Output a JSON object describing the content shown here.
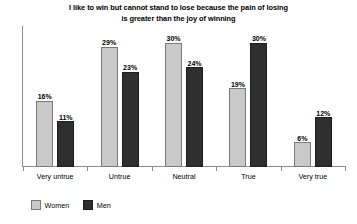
{
  "chart_data": {
    "type": "bar",
    "title": "I like to win but cannot stand to lose because the pain of losing is greater than the joy of winning",
    "title_lines": [
      "I like to win but cannot stand to lose because the pain of losing",
      "is greater than the joy of winning"
    ],
    "xlabel": "",
    "ylabel": "",
    "ylim": [
      0,
      34
    ],
    "grid": false,
    "legend_position": "bottom-left",
    "value_suffix": "%",
    "categories": [
      "Very untrue",
      "Untrue",
      "Neutral",
      "True",
      "Very true"
    ],
    "series": [
      {
        "name": "Women",
        "color": "#c9c9c9",
        "border_color": "#7a7a7a",
        "values": [
          16,
          29,
          30,
          19,
          6
        ],
        "labels": [
          "16%",
          "29%",
          "30%",
          "19%",
          "6%"
        ]
      },
      {
        "name": "Men",
        "color": "#2f2f2f",
        "border_color": "#1c1c1c",
        "values": [
          11,
          23,
          24,
          30,
          12
        ],
        "labels": [
          "11%",
          "23%",
          "24%",
          "30%",
          "12%"
        ]
      }
    ]
  },
  "legend": {
    "items": [
      {
        "label": "Women",
        "swatch": "legend-swatch-women"
      },
      {
        "label": "Men",
        "swatch": "legend-swatch-men"
      }
    ]
  }
}
